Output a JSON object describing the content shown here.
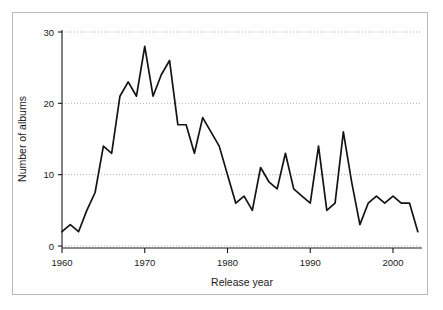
{
  "figure": {
    "background_color": "#ffffff",
    "frame_color": "#b9b9b9",
    "line_color": "#141414",
    "grid_color": "#9a9a9a"
  },
  "chart_data": {
    "type": "line",
    "title": "",
    "xlabel": "Release year",
    "ylabel": "Number of albums",
    "xlim": [
      1960,
      2003
    ],
    "ylim": [
      0,
      30
    ],
    "xticks": [
      1960,
      1970,
      1980,
      1990,
      2000
    ],
    "xtick_labels": [
      "1960",
      "1970",
      "1980",
      "1990",
      "2000"
    ],
    "yticks": [
      0,
      10,
      20,
      30
    ],
    "ytick_labels": [
      "0",
      "10",
      "20",
      "30"
    ],
    "grid": "horizontal-dotted",
    "legend": "none",
    "x": [
      1960,
      1961,
      1962,
      1963,
      1964,
      1965,
      1966,
      1967,
      1968,
      1969,
      1970,
      1971,
      1972,
      1973,
      1974,
      1975,
      1976,
      1977,
      1978,
      1979,
      1980,
      1981,
      1982,
      1983,
      1984,
      1985,
      1986,
      1987,
      1988,
      1989,
      1990,
      1991,
      1992,
      1993,
      1994,
      1995,
      1996,
      1997,
      1998,
      1999,
      2000,
      2001,
      2002,
      2003
    ],
    "values": [
      2,
      3,
      2,
      5,
      7.5,
      14,
      13,
      21,
      23,
      21,
      28,
      21,
      24,
      26,
      17,
      17,
      13,
      18,
      16,
      14,
      10,
      6,
      7,
      5,
      11,
      9,
      8,
      13,
      8,
      7,
      6,
      14,
      5,
      6,
      16,
      9,
      3,
      6,
      7,
      6,
      7,
      6,
      6,
      2
    ],
    "series_name": "Number of albums"
  }
}
